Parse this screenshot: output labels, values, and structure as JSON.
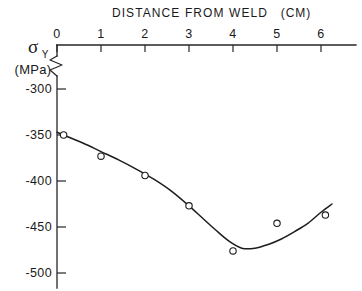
{
  "chart_data": {
    "type": "scatter",
    "title": "DISTANCE  FROM  WELD",
    "title_units": "(CM)",
    "xlabel": "DISTANCE FROM WELD (CM)",
    "ylabel": "σ",
    "ylabel_subscript": "Y",
    "ylabel_units": "(MPa)",
    "xlim": [
      0,
      6.8
    ],
    "ylim": [
      -510,
      -278
    ],
    "y_axis_broken": true,
    "grid": false,
    "legend": false,
    "x_ticks": [
      0,
      1,
      2,
      3,
      4,
      5,
      6
    ],
    "x_tick_labels": [
      "0",
      "1",
      "2",
      "3",
      "4",
      "5",
      "6"
    ],
    "y_ticks": [
      -300,
      -350,
      -400,
      -450,
      -500
    ],
    "y_tick_labels": [
      "-300",
      "-350",
      "-400",
      "-450",
      "-500"
    ],
    "series": [
      {
        "name": "measured",
        "marker": "open-circle",
        "x": [
          0.15,
          1.0,
          2.0,
          3.0,
          4.0,
          5.0,
          6.1
        ],
        "y": [
          -350,
          -373,
          -394,
          -427,
          -476,
          -446,
          -437
        ]
      }
    ],
    "fit_curve": {
      "name": "fitted curve",
      "x": [
        0.0,
        0.3,
        0.6,
        1.0,
        1.4,
        1.8,
        2.2,
        2.6,
        3.0,
        3.3,
        3.6,
        3.9,
        4.2,
        4.5,
        4.8,
        5.1,
        5.4,
        5.7,
        6.0,
        6.25
      ],
      "y": [
        -347,
        -353,
        -359,
        -368,
        -377,
        -387,
        -398,
        -411,
        -427,
        -440,
        -453,
        -465,
        -473,
        -473,
        -469,
        -463,
        -455,
        -446,
        -434,
        -425
      ]
    },
    "colors": {
      "axis": "#262626",
      "curve": "#1d1d1d",
      "marker_fill": "#ffffff",
      "background": "#ffffff"
    }
  }
}
